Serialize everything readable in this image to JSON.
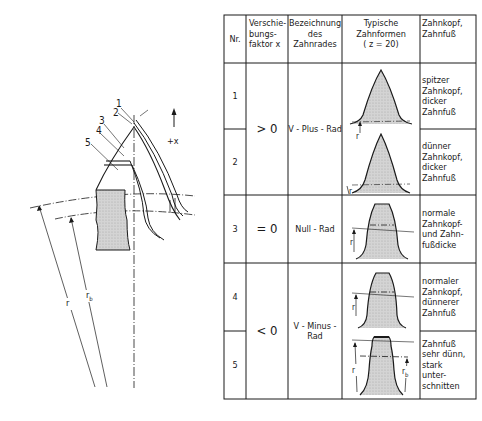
{
  "gear_diagram": {
    "profile_labels": [
      "1",
      "2",
      "3",
      "4",
      "5"
    ],
    "direction_label": "+x",
    "radius_label": "r",
    "base_radius_label": "r",
    "base_radius_subscript": "b"
  },
  "table": {
    "headers": {
      "nr": "Nr.",
      "factor": [
        "Verschie-",
        "bungs-",
        "faktor x"
      ],
      "name": [
        "Bezeichnung",
        "des",
        "Zahnrades"
      ],
      "shape": [
        "Typische",
        "Zahnformen",
        "( z = 20)"
      ],
      "tip_root": [
        "Zahnkopf,",
        "Zahnfuß"
      ]
    },
    "groups": [
      {
        "factor": "> 0",
        "name": [
          "V - Plus - Rad"
        ],
        "rows": [
          "1",
          "2"
        ]
      },
      {
        "factor": "= 0",
        "name": [
          "Null - Rad"
        ],
        "rows": [
          "3"
        ]
      },
      {
        "factor": "< 0",
        "name": [
          "V - Minus -",
          "Rad"
        ],
        "rows": [
          "4",
          "5"
        ]
      }
    ],
    "rows": [
      {
        "nr": "1",
        "description": [
          "spitzer",
          "Zahnkopf,",
          "dicker",
          "Zahnfuß"
        ]
      },
      {
        "nr": "2",
        "description": [
          "dünner",
          "Zahnkopf,",
          "dicker",
          "Zahnfuß"
        ]
      },
      {
        "nr": "3",
        "description": [
          "normale",
          "Zahnkopf-",
          "und Zahn-",
          "fußdicke"
        ]
      },
      {
        "nr": "4",
        "description": [
          "normaler",
          "Zahnkopf,",
          "dünnerer",
          "Zahnfuß"
        ]
      },
      {
        "nr": "5",
        "description": [
          "Zahnfuß",
          "sehr dünn,",
          "stark",
          "unter-",
          "schnitten"
        ]
      }
    ],
    "tooth_labels": {
      "r": "r",
      "rb": "r",
      "rb_sub": "b"
    }
  },
  "colors": {
    "line": "#1a1a1a",
    "fill": "#cfcfcf",
    "background": "#ffffff"
  }
}
